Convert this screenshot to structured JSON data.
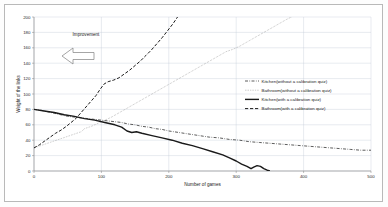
{
  "figure": {
    "background_color": "#ffffff",
    "frame_color": "#b9b9b9",
    "grid_color": "#c5cdd8",
    "axis_color": "#808080"
  },
  "annotation": {
    "label": "Improvement",
    "arrow_direction": "left",
    "arrow_icon": "left-block-arrow-icon",
    "arrow_fill": "#ffffff",
    "arrow_stroke": "#808080"
  },
  "chart_data": {
    "type": "line",
    "title": "",
    "xlabel": "Number of games",
    "ylabel": "Weight of the links",
    "xlim": [
      0,
      500
    ],
    "ylim": [
      0,
      200
    ],
    "xticks": [
      0,
      100,
      200,
      300,
      400,
      500
    ],
    "yticks": [
      0,
      20,
      40,
      60,
      80,
      100,
      120,
      140,
      160,
      180,
      200
    ],
    "xtick_labels": [
      "0",
      "100",
      "200",
      "300",
      "400",
      "500"
    ],
    "ytick_labels": [
      "0",
      "20",
      "40",
      "60",
      "80",
      "100",
      "120",
      "140",
      "160",
      "180",
      "200"
    ],
    "grid": true,
    "legend_position": "center-right",
    "series": [
      {
        "name": "Kitchen(without a calibration quiz)",
        "style": "dash-dot",
        "color": "#333333",
        "width": 0.8,
        "points": [
          [
            0,
            80
          ],
          [
            10,
            79
          ],
          [
            20,
            77
          ],
          [
            30,
            75
          ],
          [
            40,
            73
          ],
          [
            50,
            71
          ],
          [
            60,
            70
          ],
          [
            70,
            69
          ],
          [
            80,
            68
          ],
          [
            90,
            67
          ],
          [
            100,
            66
          ],
          [
            110,
            65
          ],
          [
            120,
            64
          ],
          [
            130,
            63
          ],
          [
            140,
            61
          ],
          [
            150,
            60
          ],
          [
            160,
            58
          ],
          [
            170,
            57
          ],
          [
            180,
            55
          ],
          [
            190,
            54
          ],
          [
            200,
            52
          ],
          [
            215,
            50
          ],
          [
            230,
            48
          ],
          [
            245,
            46
          ],
          [
            260,
            44
          ],
          [
            275,
            43
          ],
          [
            290,
            41
          ],
          [
            305,
            40
          ],
          [
            320,
            38
          ],
          [
            335,
            37
          ],
          [
            350,
            36
          ],
          [
            365,
            35
          ],
          [
            380,
            34
          ],
          [
            395,
            33
          ],
          [
            410,
            32
          ],
          [
            425,
            31
          ],
          [
            440,
            30
          ],
          [
            455,
            29
          ],
          [
            470,
            28
          ],
          [
            485,
            27
          ],
          [
            500,
            27
          ]
        ]
      },
      {
        "name": "Bathroom(without a calibration quiz)",
        "style": "dotted",
        "color": "#8a8a8a",
        "width": 0.7,
        "points": [
          [
            0,
            30
          ],
          [
            10,
            33
          ],
          [
            20,
            36
          ],
          [
            30,
            39
          ],
          [
            40,
            42
          ],
          [
            50,
            45
          ],
          [
            60,
            48
          ],
          [
            70,
            51
          ],
          [
            75,
            55
          ],
          [
            85,
            58
          ],
          [
            95,
            62
          ],
          [
            105,
            66
          ],
          [
            115,
            70
          ],
          [
            125,
            75
          ],
          [
            135,
            80
          ],
          [
            145,
            85
          ],
          [
            155,
            90
          ],
          [
            165,
            95
          ],
          [
            175,
            100
          ],
          [
            185,
            105
          ],
          [
            195,
            110
          ],
          [
            205,
            115
          ],
          [
            215,
            120
          ],
          [
            225,
            125
          ],
          [
            235,
            130
          ],
          [
            245,
            135
          ],
          [
            255,
            140
          ],
          [
            265,
            145
          ],
          [
            275,
            150
          ],
          [
            285,
            155
          ],
          [
            295,
            158
          ],
          [
            305,
            162
          ],
          [
            315,
            167
          ],
          [
            325,
            172
          ],
          [
            335,
            177
          ],
          [
            345,
            182
          ],
          [
            355,
            187
          ],
          [
            365,
            192
          ],
          [
            375,
            197
          ],
          [
            382,
            200
          ]
        ]
      },
      {
        "name": "Kitchen(with a calibration quiz)",
        "style": "solid",
        "color": "#1a1a1a",
        "width": 1.4,
        "points": [
          [
            0,
            80
          ],
          [
            15,
            78
          ],
          [
            30,
            76
          ],
          [
            45,
            73
          ],
          [
            60,
            71
          ],
          [
            75,
            68
          ],
          [
            90,
            66
          ],
          [
            105,
            63
          ],
          [
            120,
            60
          ],
          [
            130,
            57
          ],
          [
            138,
            52
          ],
          [
            145,
            50
          ],
          [
            152,
            51
          ],
          [
            160,
            49
          ],
          [
            175,
            46
          ],
          [
            190,
            43
          ],
          [
            205,
            40
          ],
          [
            220,
            36
          ],
          [
            235,
            33
          ],
          [
            250,
            29
          ],
          [
            265,
            25
          ],
          [
            280,
            21
          ],
          [
            290,
            17
          ],
          [
            300,
            13
          ],
          [
            308,
            9
          ],
          [
            316,
            6
          ],
          [
            322,
            3
          ],
          [
            326,
            5
          ],
          [
            331,
            7
          ],
          [
            336,
            6
          ],
          [
            341,
            3
          ],
          [
            346,
            1
          ],
          [
            350,
            0
          ]
        ]
      },
      {
        "name": "Bathroom(with a calibration quiz)",
        "style": "dashed",
        "color": "#1a1a1a",
        "width": 1.0,
        "points": [
          [
            0,
            30
          ],
          [
            8,
            34
          ],
          [
            16,
            39
          ],
          [
            24,
            44
          ],
          [
            32,
            49
          ],
          [
            40,
            53
          ],
          [
            48,
            58
          ],
          [
            55,
            63
          ],
          [
            62,
            68
          ],
          [
            68,
            74
          ],
          [
            74,
            80
          ],
          [
            80,
            86
          ],
          [
            86,
            92
          ],
          [
            92,
            98
          ],
          [
            98,
            106
          ],
          [
            104,
            113
          ],
          [
            110,
            116
          ],
          [
            118,
            118
          ],
          [
            126,
            121
          ],
          [
            134,
            126
          ],
          [
            142,
            131
          ],
          [
            150,
            137
          ],
          [
            158,
            143
          ],
          [
            166,
            150
          ],
          [
            174,
            157
          ],
          [
            182,
            165
          ],
          [
            190,
            173
          ],
          [
            198,
            182
          ],
          [
            206,
            191
          ],
          [
            213,
            200
          ]
        ]
      }
    ]
  }
}
